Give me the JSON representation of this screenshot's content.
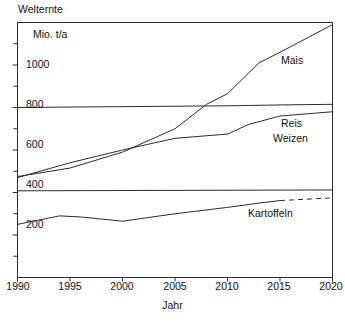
{
  "chart_data": {
    "type": "line",
    "title": "Welternte",
    "ylabel": "Mio. t/a",
    "xlabel": "Jahr",
    "grid": false,
    "legend_position": "inline-right",
    "xlim": [
      1990,
      2020
    ],
    "ylim": [
      0,
      1200
    ],
    "xticks": [
      1990,
      1995,
      2000,
      2005,
      2010,
      2015,
      2020
    ],
    "xtick_labels": [
      "1990",
      "1995",
      "2000",
      "2005",
      "2010",
      "2015",
      "2020"
    ],
    "yticks": [
      200,
      400,
      600,
      800,
      1000
    ],
    "ytick_labels": [
      "200",
      "400",
      "600",
      "800",
      "1000"
    ],
    "yminor_ticks": [
      100,
      300,
      500,
      700,
      900,
      1100
    ],
    "series": [
      {
        "name": "Mais",
        "style": "solid",
        "x": [
          1990,
          1995,
          2000,
          2005,
          2008,
          2010,
          2013,
          2015,
          2020
        ],
        "values": [
          475,
          515,
          590,
          700,
          815,
          865,
          1010,
          1060,
          1190
        ]
      },
      {
        "name": "Reis",
        "style": "solid",
        "x": [
          1990,
          1995,
          2000,
          2005,
          2010,
          2012,
          2015,
          2020
        ],
        "values": [
          470,
          540,
          600,
          655,
          675,
          720,
          760,
          780
        ]
      },
      {
        "name": "Weizen",
        "style": "solid",
        "x": [
          1990,
          1995,
          2000,
          2005,
          2010,
          2015,
          2020
        ],
        "values": [
          800,
          802,
          804,
          806,
          808,
          812,
          815
        ]
      },
      {
        "name": "Kartoffeln",
        "style": "solid-then-dashed",
        "dash_from": 2015,
        "x": [
          1990,
          1994,
          1996,
          2000,
          2005,
          2010,
          2013,
          2015,
          2020
        ],
        "values": [
          250,
          290,
          285,
          265,
          300,
          330,
          350,
          362,
          375
        ]
      },
      {
        "name": "Weizen-upper",
        "style": "solid",
        "x": [
          1990,
          2020
        ],
        "values": [
          408,
          412
        ]
      }
    ],
    "series_labels": [
      {
        "text": "Mais",
        "x": 1995,
        "y": 0
      },
      {
        "text": "Reis",
        "x": 0,
        "y": 0
      },
      {
        "text": "Weizen",
        "x": 0,
        "y": 0
      },
      {
        "text": "Kartoffeln",
        "x": 0,
        "y": 0
      }
    ]
  },
  "labels": {
    "title": "Welternte",
    "unit": "Mio. t/a",
    "xaxis": "Jahr",
    "mais": "Mais",
    "reis": "Reis",
    "weizen": "Weizen",
    "kartoffeln": "Kartoffeln",
    "y1000": "1000",
    "y800": "800",
    "y600": "600",
    "y400": "400",
    "y200": "200",
    "x1990": "1990",
    "x1995": "1995",
    "x2000": "2000",
    "x2005": "2005",
    "x2010": "2010",
    "x2015": "2015",
    "x2020": "2020"
  },
  "colors": {
    "line": "#2b2b2b",
    "frame": "#2b2b2b",
    "text": "#111111",
    "background": "#ffffff"
  }
}
